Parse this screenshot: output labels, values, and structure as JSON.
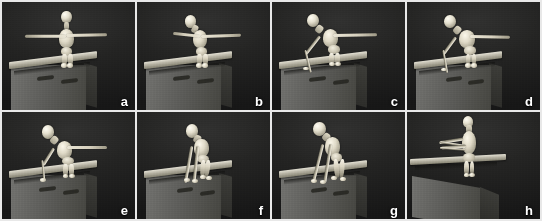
{
  "figure": {
    "layout": {
      "columns": 4,
      "rows": 2,
      "total_panels": 8
    },
    "background_color": "#1b1b1b",
    "label_color": "#ffffff",
    "divider_color": "#e8e8e8",
    "panels": [
      {
        "label": "a",
        "caption": "Standing upright, arms extended horizontally",
        "view": "three-quarter",
        "pose": "t-pose-standing"
      },
      {
        "label": "b",
        "caption": "Head begins to tilt, torso starts leaning forward",
        "view": "three-quarter",
        "pose": "lean-start"
      },
      {
        "label": "c",
        "caption": "Torso bent forward, near arm reaching down to beam",
        "view": "three-quarter",
        "pose": "reach-down"
      },
      {
        "label": "d",
        "caption": "Hand contacts the beam, far arm still extended",
        "view": "three-quarter",
        "pose": "hand-contact"
      },
      {
        "label": "e",
        "caption": "Deeper forward bend, weight shifting onto the near arm",
        "view": "three-quarter",
        "pose": "deep-bend"
      },
      {
        "label": "f",
        "caption": "Crouched, both arms planted on the beam",
        "view": "three-quarter",
        "pose": "both-hands-planted"
      },
      {
        "label": "g",
        "caption": "Quadruped crouch with legs folded under the torso",
        "view": "three-quarter",
        "pose": "quadruped-crouch"
      },
      {
        "label": "h",
        "caption": "Frontal view, arms folded in front of the body",
        "view": "frontal",
        "pose": "arms-folded-front"
      }
    ]
  }
}
